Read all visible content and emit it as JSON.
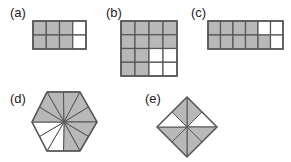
{
  "colors": {
    "shaded": "#b8b8b8",
    "unshaded": "#ffffff",
    "stroke": "#555555"
  },
  "figures": [
    {
      "id": "a",
      "label": "(a)",
      "type": "grid",
      "cols": 4,
      "rows": 2,
      "x": 33,
      "y": 21,
      "w": 53,
      "h": 28,
      "shaded": [
        [
          1,
          1,
          1,
          0
        ],
        [
          1,
          1,
          1,
          0
        ]
      ],
      "shaded_count": 6,
      "total": 8
    },
    {
      "id": "b",
      "label": "(b)",
      "type": "grid",
      "cols": 4,
      "rows": 4,
      "x": 121,
      "y": 21,
      "w": 56,
      "h": 55,
      "shaded": [
        [
          1,
          1,
          1,
          1
        ],
        [
          1,
          1,
          1,
          1
        ],
        [
          1,
          1,
          0,
          0
        ],
        [
          1,
          1,
          0,
          0
        ]
      ],
      "shaded_count": 12,
      "total": 16
    },
    {
      "id": "c",
      "label": "(c)",
      "type": "grid",
      "cols": 6,
      "rows": 2,
      "x": 208,
      "y": 21,
      "w": 75,
      "h": 28,
      "shaded": [
        [
          1,
          1,
          1,
          1,
          0,
          0
        ],
        [
          1,
          1,
          1,
          1,
          1,
          0
        ]
      ],
      "shaded_count": 9,
      "total": 12
    },
    {
      "id": "d",
      "label": "(d)",
      "type": "hexagon",
      "cx": 64,
      "cy": 122,
      "sectors": 12,
      "unshaded_sectors": [
        7,
        8,
        9
      ],
      "shaded_count": 9,
      "total": 12
    },
    {
      "id": "e",
      "label": "(e)",
      "type": "diamond",
      "cx": 187,
      "cy": 127,
      "r": 30,
      "sectors": 8,
      "unshaded_sectors": [
        3,
        4
      ],
      "shaded_count": 6,
      "total": 8
    }
  ]
}
